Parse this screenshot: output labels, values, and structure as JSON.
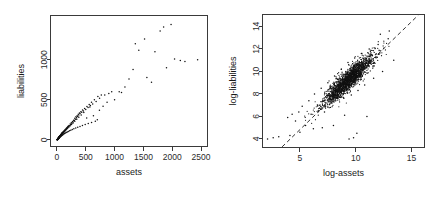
{
  "figure": {
    "background": "#ffffff",
    "point_color": "#111111",
    "axis_color": "#3a3a3a",
    "refline_color": "#1c1c1c"
  },
  "chart_data": [
    {
      "type": "scatter",
      "title": "",
      "xlabel": "assets",
      "ylabel": "liabilities",
      "xlim": [
        -120,
        2620
      ],
      "ylim": [
        -90,
        1560
      ],
      "xticks": [
        0,
        500,
        1000,
        1500,
        2000,
        2500
      ],
      "yticks": [
        0,
        500,
        1000
      ],
      "grid": false,
      "legend": "none",
      "panel": "left",
      "points": [
        [
          4,
          2
        ],
        [
          6,
          3
        ],
        [
          7,
          1
        ],
        [
          8,
          5
        ],
        [
          9,
          4
        ],
        [
          10,
          6
        ],
        [
          11,
          3
        ],
        [
          12,
          8
        ],
        [
          13,
          7
        ],
        [
          14,
          10
        ],
        [
          15,
          9
        ],
        [
          16,
          12
        ],
        [
          17,
          8
        ],
        [
          18,
          14
        ],
        [
          19,
          11
        ],
        [
          20,
          15
        ],
        [
          21,
          13
        ],
        [
          22,
          18
        ],
        [
          23,
          16
        ],
        [
          24,
          20
        ],
        [
          25,
          17
        ],
        [
          26,
          22
        ],
        [
          27,
          19
        ],
        [
          28,
          24
        ],
        [
          29,
          21
        ],
        [
          30,
          26
        ],
        [
          31,
          23
        ],
        [
          32,
          28
        ],
        [
          33,
          25
        ],
        [
          34,
          30
        ],
        [
          35,
          27
        ],
        [
          36,
          32
        ],
        [
          37,
          29
        ],
        [
          38,
          34
        ],
        [
          39,
          31
        ],
        [
          40,
          36
        ],
        [
          41,
          33
        ],
        [
          42,
          38
        ],
        [
          43,
          35
        ],
        [
          44,
          40
        ],
        [
          45,
          37
        ],
        [
          46,
          42
        ],
        [
          47,
          39
        ],
        [
          48,
          44
        ],
        [
          49,
          41
        ],
        [
          50,
          46
        ],
        [
          52,
          43
        ],
        [
          54,
          48
        ],
        [
          56,
          45
        ],
        [
          58,
          52
        ],
        [
          60,
          49
        ],
        [
          62,
          56
        ],
        [
          64,
          53
        ],
        [
          66,
          60
        ],
        [
          68,
          57
        ],
        [
          70,
          64
        ],
        [
          72,
          61
        ],
        [
          74,
          68
        ],
        [
          76,
          65
        ],
        [
          78,
          72
        ],
        [
          80,
          69
        ],
        [
          82,
          76
        ],
        [
          84,
          73
        ],
        [
          86,
          80
        ],
        [
          88,
          77
        ],
        [
          90,
          84
        ],
        [
          92,
          81
        ],
        [
          94,
          88
        ],
        [
          96,
          85
        ],
        [
          98,
          92
        ],
        [
          100,
          89
        ],
        [
          105,
          96
        ],
        [
          110,
          93
        ],
        [
          115,
          104
        ],
        [
          120,
          101
        ],
        [
          125,
          112
        ],
        [
          130,
          109
        ],
        [
          135,
          120
        ],
        [
          140,
          117
        ],
        [
          145,
          128
        ],
        [
          150,
          125
        ],
        [
          155,
          136
        ],
        [
          160,
          133
        ],
        [
          165,
          144
        ],
        [
          170,
          141
        ],
        [
          175,
          152
        ],
        [
          180,
          149
        ],
        [
          185,
          160
        ],
        [
          190,
          157
        ],
        [
          195,
          168
        ],
        [
          200,
          165
        ],
        [
          210,
          180
        ],
        [
          220,
          176
        ],
        [
          230,
          196
        ],
        [
          240,
          192
        ],
        [
          250,
          212
        ],
        [
          260,
          208
        ],
        [
          270,
          228
        ],
        [
          280,
          224
        ],
        [
          290,
          244
        ],
        [
          300,
          240
        ],
        [
          310,
          268
        ],
        [
          320,
          258
        ],
        [
          330,
          288
        ],
        [
          340,
          276
        ],
        [
          350,
          300
        ],
        [
          360,
          292
        ],
        [
          370,
          318
        ],
        [
          380,
          310
        ],
        [
          390,
          336
        ],
        [
          400,
          328
        ],
        [
          415,
          352
        ],
        [
          430,
          344
        ],
        [
          445,
          372
        ],
        [
          460,
          360
        ],
        [
          480,
          392
        ],
        [
          500,
          380
        ],
        [
          520,
          416
        ],
        [
          540,
          404
        ],
        [
          560,
          440
        ],
        [
          580,
          428
        ],
        [
          600,
          468
        ],
        [
          620,
          448
        ],
        [
          650,
          500
        ],
        [
          680,
          480
        ],
        [
          710,
          540
        ],
        [
          740,
          520
        ],
        [
          770,
          560
        ],
        [
          800,
          420
        ],
        [
          830,
          560
        ],
        [
          870,
          470
        ],
        [
          900,
          580
        ],
        [
          950,
          600
        ],
        [
          1000,
          500
        ],
        [
          1080,
          600
        ],
        [
          1120,
          590
        ],
        [
          1180,
          660
        ],
        [
          1250,
          760
        ],
        [
          1320,
          880
        ],
        [
          1360,
          1200
        ],
        [
          1420,
          1120
        ],
        [
          1520,
          1260
        ],
        [
          1560,
          780
        ],
        [
          1640,
          720
        ],
        [
          1700,
          1100
        ],
        [
          1790,
          1360
        ],
        [
          1850,
          1410
        ],
        [
          1900,
          900
        ],
        [
          1980,
          1440
        ],
        [
          2040,
          1010
        ],
        [
          2140,
          990
        ],
        [
          2220,
          980
        ],
        [
          2440,
          1000
        ],
        [
          5,
          1
        ],
        [
          7,
          4
        ],
        [
          9,
          2
        ],
        [
          11,
          7
        ],
        [
          13,
          4
        ],
        [
          15,
          11
        ],
        [
          17,
          6
        ],
        [
          19,
          14
        ],
        [
          21,
          9
        ],
        [
          23,
          19
        ],
        [
          25,
          12
        ],
        [
          27,
          23
        ],
        [
          29,
          15
        ],
        [
          31,
          27
        ],
        [
          33,
          18
        ],
        [
          35,
          31
        ],
        [
          37,
          21
        ],
        [
          39,
          35
        ],
        [
          41,
          24
        ],
        [
          43,
          39
        ],
        [
          45,
          28
        ],
        [
          47,
          43
        ],
        [
          49,
          32
        ],
        [
          53,
          47
        ],
        [
          57,
          36
        ],
        [
          61,
          53
        ],
        [
          65,
          41
        ],
        [
          69,
          59
        ],
        [
          73,
          46
        ],
        [
          77,
          65
        ],
        [
          81,
          51
        ],
        [
          85,
          71
        ],
        [
          89,
          56
        ],
        [
          93,
          77
        ],
        [
          97,
          61
        ],
        [
          103,
          83
        ],
        [
          108,
          66
        ],
        [
          114,
          92
        ],
        [
          119,
          72
        ],
        [
          126,
          101
        ],
        [
          132,
          78
        ],
        [
          139,
          110
        ],
        [
          146,
          85
        ],
        [
          154,
          122
        ],
        [
          162,
          91
        ],
        [
          171,
          134
        ],
        [
          179,
          98
        ],
        [
          188,
          146
        ],
        [
          197,
          105
        ],
        [
          208,
          160
        ],
        [
          218,
          112
        ],
        [
          229,
          176
        ],
        [
          241,
          120
        ],
        [
          254,
          192
        ],
        [
          266,
          128
        ],
        [
          280,
          210
        ],
        [
          294,
          137
        ],
        [
          310,
          232
        ],
        [
          326,
          146
        ],
        [
          344,
          256
        ],
        [
          361,
          156
        ],
        [
          380,
          282
        ],
        [
          400,
          167
        ],
        [
          421,
          310
        ],
        [
          443,
          178
        ],
        [
          466,
          342
        ],
        [
          490,
          190
        ],
        [
          516,
          272
        ],
        [
          543,
          203
        ],
        [
          571,
          410
        ],
        [
          601,
          217
        ],
        [
          633,
          300
        ],
        [
          666,
          232
        ],
        [
          701,
          250
        ],
        [
          737,
          370
        ]
      ]
    },
    {
      "type": "scatter",
      "title": "",
      "xlabel": "log-assets",
      "ylabel": "log-liabilities",
      "xlim": [
        1.6,
        16.2
      ],
      "ylim": [
        3.2,
        15.1
      ],
      "xticks": [
        5,
        10,
        15
      ],
      "yticks": [
        4,
        6,
        8,
        10,
        12,
        14
      ],
      "grid": false,
      "legend": "none",
      "panel": "right",
      "reference_line": {
        "style": "dashed",
        "x": [
          3.4,
          15.6
        ],
        "y": [
          3.3,
          15.0
        ]
      },
      "cluster": {
        "center_x": 9.3,
        "center_y": 9.2,
        "slope": 1.0,
        "spread_along": 1.55,
        "spread_across": 0.35,
        "n": 1900
      },
      "outliers": [
        [
          2.1,
          4.0
        ],
        [
          2.6,
          4.1
        ],
        [
          3.1,
          4.2
        ],
        [
          3.9,
          5.9
        ],
        [
          4.3,
          6.2
        ],
        [
          4.6,
          5.6
        ],
        [
          4.9,
          6.4
        ],
        [
          5.2,
          6.9
        ],
        [
          5.0,
          4.6
        ],
        [
          5.5,
          5.2
        ],
        [
          5.8,
          7.4
        ],
        [
          6.0,
          6.2
        ],
        [
          6.3,
          8.0
        ],
        [
          6.6,
          7.0
        ],
        [
          6.9,
          8.5
        ],
        [
          7.2,
          6.4
        ],
        [
          7.5,
          9.0
        ],
        [
          7.8,
          7.2
        ],
        [
          8.1,
          9.6
        ],
        [
          8.4,
          7.6
        ],
        [
          8.7,
          10.2
        ],
        [
          9.0,
          6.1
        ],
        [
          9.3,
          10.8
        ],
        [
          9.6,
          7.9
        ],
        [
          9.9,
          11.2
        ],
        [
          10.2,
          8.3
        ],
        [
          10.5,
          11.6
        ],
        [
          10.8,
          8.8
        ],
        [
          11.2,
          12.0
        ],
        [
          11.6,
          9.4
        ],
        [
          12.0,
          12.4
        ],
        [
          12.4,
          10.0
        ],
        [
          12.9,
          12.9
        ],
        [
          13.4,
          11.0
        ],
        [
          4.1,
          4.3
        ],
        [
          9.4,
          4.0
        ],
        [
          9.8,
          4.1
        ],
        [
          10.1,
          4.5
        ],
        [
          8.0,
          5.2
        ],
        [
          7.0,
          5.0
        ],
        [
          6.2,
          4.9
        ],
        [
          11.0,
          6.0
        ],
        [
          12.2,
          13.3
        ],
        [
          13.0,
          13.6
        ]
      ]
    }
  ]
}
